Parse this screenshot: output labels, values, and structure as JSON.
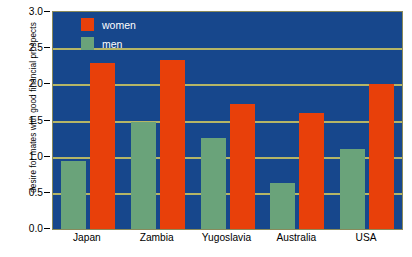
{
  "chart_data": {
    "type": "bar",
    "title": "",
    "subtitle": "",
    "xlabel": "",
    "ylabel": "desire for mates with good financial prospects",
    "ylim": [
      0.0,
      3.0
    ],
    "ytick_labels": [
      "0.0",
      "0.5",
      "1.0",
      "1.5",
      "2.0",
      "2.5",
      "3.0"
    ],
    "ytick_values": [
      0.0,
      0.5,
      1.0,
      1.5,
      2.0,
      2.5,
      3.0
    ],
    "grid": true,
    "gridlines_at": [
      0.5,
      1.0,
      1.5,
      2.0,
      2.5
    ],
    "legend_position": "top-left-inside",
    "categories": [
      "Japan",
      "Zambia",
      "Yugoslavia",
      "Australia",
      "USA"
    ],
    "series": [
      {
        "name": "women",
        "color": "#e8400a",
        "values": [
          2.3,
          2.34,
          1.73,
          1.6,
          2.0
        ]
      },
      {
        "name": "men",
        "color": "#6aa37a",
        "values": [
          0.94,
          1.48,
          1.26,
          0.64,
          1.1
        ]
      }
    ],
    "series_order_in_group": [
      "men",
      "women"
    ],
    "plot_background_color": "#17478c",
    "gridline_color": "#b5b566",
    "axis_text_color": "#000000",
    "legend_text_color": "#ffffff"
  },
  "legend": {
    "items": [
      {
        "label": "women",
        "swatch_name": "legend-swatch-women"
      },
      {
        "label": "men",
        "swatch_name": "legend-swatch-men"
      }
    ]
  }
}
